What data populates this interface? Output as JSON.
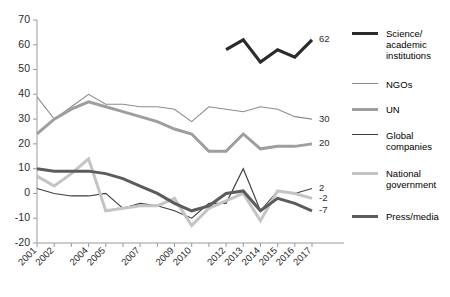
{
  "chart_data": {
    "type": "line",
    "title": "",
    "xlabel": "",
    "ylabel": "",
    "ylim": [
      -20,
      70
    ],
    "yticks": [
      -20,
      -10,
      0,
      10,
      20,
      30,
      40,
      50,
      60,
      70
    ],
    "grid": false,
    "legend_position": "right",
    "x": [
      2001,
      2002,
      2003,
      2004,
      2005,
      2006,
      2007,
      2008,
      2009,
      2010,
      2011,
      2012,
      2013,
      2014,
      2015,
      2016,
      2017
    ],
    "xtick_labels": [
      "2001",
      "2002",
      "",
      "2004",
      "2005",
      "",
      "2007",
      "",
      "2009",
      "2010",
      "",
      "2012",
      "2013",
      "2014",
      "2015",
      "2016",
      "2017"
    ],
    "series": [
      {
        "name": "Science/academic institutions",
        "color": "#2b2b2b",
        "width": 3.2,
        "end_label": "62",
        "x": [
          2012,
          2013,
          2014,
          2015,
          2016,
          2017
        ],
        "values": [
          58,
          62,
          53,
          58,
          55,
          62
        ]
      },
      {
        "name": "NGOs",
        "color": "#8c8c8c",
        "width": 1.1,
        "end_label": "30",
        "x": [
          2001,
          2002,
          2003,
          2004,
          2005,
          2006,
          2007,
          2008,
          2009,
          2010,
          2011,
          2012,
          2013,
          2014,
          2015,
          2016,
          2017
        ],
        "values": [
          39,
          30,
          35,
          40,
          36,
          36,
          35,
          35,
          34,
          29,
          35,
          34,
          33,
          35,
          34,
          31,
          30
        ]
      },
      {
        "name": "UN",
        "color": "#9e9e9e",
        "width": 3.0,
        "end_label": "20",
        "x": [
          2001,
          2002,
          2003,
          2004,
          2005,
          2006,
          2007,
          2008,
          2009,
          2010,
          2011,
          2012,
          2013,
          2014,
          2015,
          2016,
          2017
        ],
        "values": [
          24,
          30,
          34,
          37,
          35,
          33,
          31,
          29,
          26,
          24,
          17,
          17,
          24,
          18,
          19,
          19,
          20
        ]
      },
      {
        "name": "Global companies",
        "color": "#3d3d3d",
        "width": 1.1,
        "end_label": "2",
        "x": [
          2001,
          2002,
          2003,
          2004,
          2005,
          2006,
          2007,
          2008,
          2009,
          2010,
          2011,
          2012,
          2013,
          2014,
          2015,
          2016,
          2017
        ],
        "values": [
          2,
          0,
          -1,
          -1,
          0,
          -6,
          -4,
          -5,
          -7,
          -10,
          -4,
          -4,
          10,
          -7,
          1,
          0,
          2
        ]
      },
      {
        "name": "National government",
        "color": "#c4c4c4",
        "width": 3.0,
        "end_label": "-2",
        "x": [
          2001,
          2002,
          2003,
          2004,
          2005,
          2006,
          2007,
          2008,
          2009,
          2010,
          2011,
          2012,
          2013,
          2014,
          2015,
          2016,
          2017
        ],
        "values": [
          7,
          3,
          8,
          14,
          -7,
          -6,
          -5,
          -5,
          -2,
          -13,
          -6,
          -3,
          0,
          -11,
          1,
          0,
          -2
        ]
      },
      {
        "name": "Press/media",
        "color": "#5c5c5c",
        "width": 3.0,
        "end_label": "-7",
        "x": [
          2001,
          2002,
          2003,
          2004,
          2005,
          2006,
          2007,
          2008,
          2009,
          2010,
          2011,
          2012,
          2013,
          2014,
          2015,
          2016,
          2017
        ],
        "values": [
          10,
          9,
          9,
          9,
          8,
          6,
          3,
          0,
          -4,
          -7,
          -5,
          0,
          1,
          -7,
          -2,
          -4,
          -7
        ]
      }
    ]
  },
  "legend": {
    "items": [
      {
        "label": "Science/\nacademic\ninstitutions",
        "color": "#2b2b2b",
        "width": 3.2
      },
      {
        "label": "NGOs",
        "color": "#8c8c8c",
        "width": 1.1
      },
      {
        "label": "UN",
        "color": "#9e9e9e",
        "width": 3.0
      },
      {
        "label": "Global\ncompanies",
        "color": "#3d3d3d",
        "width": 1.8
      },
      {
        "label": "National\ngovernment",
        "color": "#c4c4c4",
        "width": 3.0
      },
      {
        "label": "Press/media",
        "color": "#5c5c5c",
        "width": 3.0
      }
    ]
  }
}
